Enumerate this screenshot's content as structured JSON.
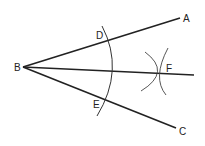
{
  "diagram": {
    "labels": {
      "A": "A",
      "B": "B",
      "C": "C",
      "D": "D",
      "E": "E",
      "F": "F"
    },
    "stroke_color": "#222222"
  }
}
